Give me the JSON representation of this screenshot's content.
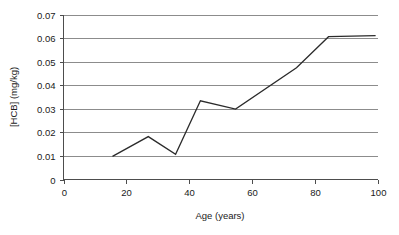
{
  "chart_data": {
    "type": "line",
    "title": "",
    "xlabel": "Age (years)",
    "ylabel": "[HCB] (mg/kg)",
    "xlim": [
      0,
      100
    ],
    "ylim": [
      0,
      0.07
    ],
    "xticks": [
      "0",
      "20",
      "40",
      "60",
      "80",
      "100"
    ],
    "xtick_values": [
      0,
      20,
      40,
      60,
      80,
      100
    ],
    "yticks": [
      "0",
      "0.01",
      "0.02",
      "0.03",
      "0.04",
      "0.05",
      "0.06",
      "0.07"
    ],
    "ytick_values": [
      0,
      0.01,
      0.02,
      0.03,
      0.04,
      0.05,
      0.06,
      0.07
    ],
    "grid": "horizontal",
    "legend": "none",
    "series": [
      {
        "name": "HCB concentration",
        "color": "#2b2b2b",
        "x": [
          15.6,
          27.0,
          35.7,
          43.6,
          54.8,
          74.2,
          84.4,
          99.4
        ],
        "y": [
          0.0098,
          0.0182,
          0.0107,
          0.0334,
          0.0299,
          0.0474,
          0.0606,
          0.061
        ]
      }
    ]
  },
  "style": {
    "grid_color": "#8c8c8c",
    "axis_color": "#4d4d4d",
    "line_color": "#2b2b2b",
    "background": "#ffffff"
  }
}
